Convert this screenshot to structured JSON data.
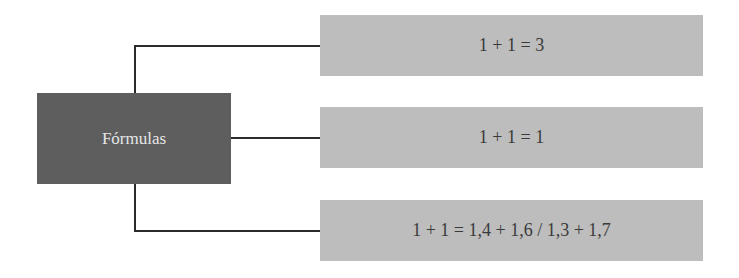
{
  "diagram": {
    "root": {
      "label": "Fórmulas"
    },
    "branches": [
      {
        "label": "1 + 1 = 3"
      },
      {
        "label": "1 + 1 = 1"
      },
      {
        "label": "1 + 1 = 1,4 + 1,6 / 1,3 + 1,7"
      }
    ],
    "colors": {
      "root_fill": "#5e5e5e",
      "root_text": "#e6e6e6",
      "leaf_fill": "#bdbdbd",
      "leaf_text": "#3a3a3a",
      "connector": "#2b2b2b"
    }
  }
}
